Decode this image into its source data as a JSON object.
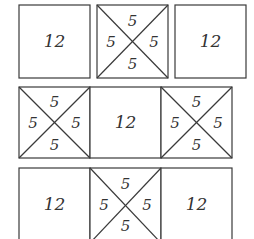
{
  "rows": [
    {
      "name": "row-1",
      "tiles": [
        {
          "type": "plain",
          "value": "12"
        },
        {
          "type": "crossed",
          "values": {
            "top": "5",
            "left": "5",
            "right": "5",
            "bottom": "5"
          }
        },
        {
          "type": "plain",
          "value": "12"
        }
      ]
    },
    {
      "name": "row-2",
      "tiles": [
        {
          "type": "crossed",
          "values": {
            "top": "5",
            "left": "5",
            "right": "5",
            "bottom": "5"
          }
        },
        {
          "type": "plain",
          "value": "12"
        },
        {
          "type": "crossed",
          "values": {
            "top": "5",
            "left": "5",
            "right": "5",
            "bottom": "5"
          }
        }
      ]
    },
    {
      "name": "row-3",
      "tiles": [
        {
          "type": "plain",
          "value": "12"
        },
        {
          "type": "crossed",
          "values": {
            "top": "5",
            "left": "5",
            "right": "5",
            "bottom": "5"
          }
        },
        {
          "type": "plain",
          "value": "12"
        }
      ]
    }
  ]
}
